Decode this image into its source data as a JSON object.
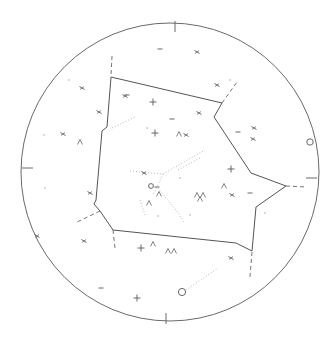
{
  "map": {
    "type": "star-chart",
    "colors": {
      "background": "#ffffff",
      "horizon": "#6a6a6a",
      "boundary": "#555555",
      "dashed": "#777777",
      "dotted": "#b8b8b8",
      "marker": "#666666"
    },
    "horizon_circle": {
      "cx": 170,
      "cy": 172,
      "r": 149
    },
    "cardinal_ticks": [
      {
        "x1": 175,
        "y1": 21,
        "x2": 175,
        "y2": 32
      },
      {
        "x1": 317,
        "y1": 178,
        "x2": 306,
        "y2": 178
      },
      {
        "x1": 166,
        "y1": 324,
        "x2": 166,
        "y2": 313
      },
      {
        "x1": 22,
        "y1": 168,
        "x2": 33,
        "y2": 168
      }
    ],
    "boundary_polygon": [
      [
        111,
        77
      ],
      [
        222,
        103
      ],
      [
        214,
        117
      ],
      [
        251,
        173
      ],
      [
        286,
        186
      ],
      [
        256,
        207
      ],
      [
        252,
        251
      ],
      [
        236,
        243
      ],
      [
        113,
        230
      ],
      [
        100,
        211
      ],
      [
        94,
        204
      ],
      [
        96,
        200
      ],
      [
        102,
        131
      ],
      [
        107,
        127
      ]
    ],
    "dashed_lines": [
      [
        [
          112,
          56
        ],
        [
          111,
          76
        ]
      ],
      [
        [
          222,
          103
        ],
        [
          237,
          82
        ]
      ],
      [
        [
          286,
          186
        ],
        [
          306,
          187
        ]
      ],
      [
        [
          113,
          230
        ],
        [
          115,
          248
        ]
      ],
      [
        [
          252,
          252
        ],
        [
          250,
          277
        ]
      ],
      [
        [
          100,
          211
        ],
        [
          75,
          223
        ]
      ]
    ],
    "dotted_lines": [
      [
        [
          112,
          128
        ],
        [
          135,
          117
        ]
      ],
      [
        [
          130,
          171
        ],
        [
          163,
          174
        ]
      ],
      [
        [
          163,
          174
        ],
        [
          205,
          150
        ]
      ],
      [
        [
          163,
          174
        ],
        [
          153,
          195
        ]
      ],
      [
        [
          158,
          188
        ],
        [
          180,
          215
        ]
      ],
      [
        [
          140,
          200
        ],
        [
          145,
          215
        ]
      ],
      [
        [
          178,
          170
        ],
        [
          200,
          158
        ]
      ],
      [
        [
          180,
          216
        ],
        [
          184,
          222
        ]
      ],
      [
        [
          186,
          290
        ],
        [
          218,
          268
        ]
      ]
    ],
    "markers": [
      {
        "type": "plus",
        "x": 153,
        "y": 102
      },
      {
        "type": "plus",
        "x": 155,
        "y": 133
      },
      {
        "type": "plus",
        "x": 137,
        "y": 298
      },
      {
        "type": "plus",
        "x": 141,
        "y": 248
      },
      {
        "type": "plus",
        "x": 231,
        "y": 169
      },
      {
        "type": "x",
        "x": 197,
        "y": 52
      },
      {
        "type": "x",
        "x": 217,
        "y": 85
      },
      {
        "type": "x",
        "x": 125,
        "y": 96
      },
      {
        "type": "x",
        "x": 82,
        "y": 88
      },
      {
        "type": "x",
        "x": 63,
        "y": 134
      },
      {
        "type": "x",
        "x": 99,
        "y": 112
      },
      {
        "type": "x",
        "x": 199,
        "y": 113
      },
      {
        "type": "x",
        "x": 186,
        "y": 135
      },
      {
        "type": "x",
        "x": 254,
        "y": 128
      },
      {
        "type": "x",
        "x": 253,
        "y": 139
      },
      {
        "type": "x",
        "x": 144,
        "y": 173
      },
      {
        "type": "x",
        "x": 232,
        "y": 195
      },
      {
        "type": "x",
        "x": 84,
        "y": 241
      },
      {
        "type": "x",
        "x": 37,
        "y": 236
      },
      {
        "type": "x",
        "x": 231,
        "y": 258
      },
      {
        "type": "x",
        "x": 90,
        "y": 193
      },
      {
        "type": "dash",
        "x": 160,
        "y": 49
      },
      {
        "type": "dash",
        "x": 127,
        "y": 95
      },
      {
        "type": "dash",
        "x": 172,
        "y": 119
      },
      {
        "type": "dash",
        "x": 250,
        "y": 193
      },
      {
        "type": "dash",
        "x": 101,
        "y": 288
      },
      {
        "type": "dash",
        "x": 157,
        "y": 187
      },
      {
        "type": "dash",
        "x": 238,
        "y": 132
      },
      {
        "type": "caret",
        "x": 80,
        "y": 142
      },
      {
        "type": "caret",
        "x": 179,
        "y": 134
      },
      {
        "type": "caret",
        "x": 159,
        "y": 194
      },
      {
        "type": "caret",
        "x": 149,
        "y": 203
      },
      {
        "type": "caret",
        "x": 197,
        "y": 195
      },
      {
        "type": "caret",
        "x": 203,
        "y": 195
      },
      {
        "type": "caret",
        "x": 200,
        "y": 199
      },
      {
        "type": "caret",
        "x": 224,
        "y": 186
      },
      {
        "type": "caret",
        "x": 153,
        "y": 244
      },
      {
        "type": "caret",
        "x": 168,
        "y": 251
      },
      {
        "type": "caret",
        "x": 174,
        "y": 251
      },
      {
        "type": "dot",
        "x": 69,
        "y": 80
      },
      {
        "type": "dot",
        "x": 44,
        "y": 135
      },
      {
        "type": "dot",
        "x": 45,
        "y": 188
      },
      {
        "type": "dot",
        "x": 147,
        "y": 128
      },
      {
        "type": "dot",
        "x": 230,
        "y": 80
      },
      {
        "type": "dot",
        "x": 265,
        "y": 213
      },
      {
        "type": "dot",
        "x": 180,
        "y": 178
      },
      {
        "type": "dot",
        "x": 190,
        "y": 215
      },
      {
        "type": "dot",
        "x": 158,
        "y": 216
      }
    ],
    "open_circles": [
      {
        "x": 310,
        "y": 142,
        "r": 3.2
      },
      {
        "x": 182,
        "y": 292,
        "r": 3.6
      },
      {
        "x": 151,
        "y": 186,
        "r": 2.4
      }
    ]
  }
}
